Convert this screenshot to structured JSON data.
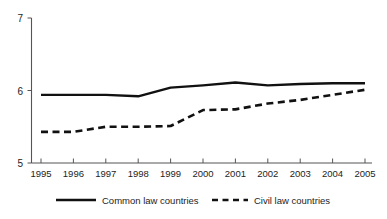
{
  "chart_data": {
    "type": "line",
    "title": "",
    "subtitle": "",
    "xlabel": "",
    "ylabel": "",
    "categories": [
      "1995",
      "1996",
      "1997",
      "1998",
      "1999",
      "2000",
      "2001",
      "2002",
      "2003",
      "2004",
      "2005"
    ],
    "x": [
      1995,
      1996,
      1997,
      1998,
      1999,
      2000,
      2001,
      2002,
      2003,
      2004,
      2005
    ],
    "series": [
      {
        "name": "Common law countries",
        "style": "solid",
        "color": "#111111",
        "values": [
          5.94,
          5.94,
          5.94,
          5.92,
          6.04,
          6.07,
          6.11,
          6.07,
          6.09,
          6.1,
          6.1
        ]
      },
      {
        "name": "Civil law countries",
        "style": "dashed",
        "color": "#111111",
        "values": [
          5.43,
          5.43,
          5.5,
          5.5,
          5.51,
          5.73,
          5.74,
          5.82,
          5.87,
          5.94,
          6.01
        ]
      }
    ],
    "ylim": [
      5,
      7
    ],
    "y_ticks": [
      5,
      6,
      7
    ],
    "y_tick_labels": [
      "5",
      "6",
      "7"
    ],
    "xlim": [
      1995,
      2005
    ],
    "grid": false,
    "legend_position": "bottom",
    "legend": [
      {
        "label": "Common law countries",
        "style": "solid"
      },
      {
        "label": "Civil law countries",
        "style": "dashed"
      }
    ]
  },
  "colors": {
    "background": "#ffffff",
    "axis": "#555555",
    "series": "#111111",
    "text": "#1d1d1d"
  }
}
